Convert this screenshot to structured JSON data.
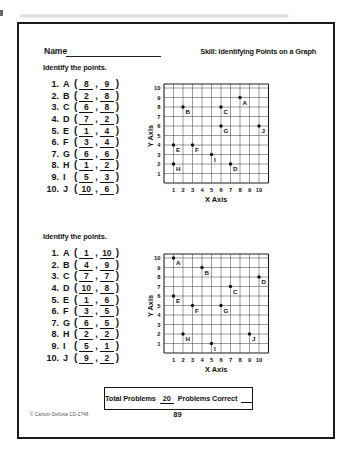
{
  "header": {
    "name_label": "Name",
    "skill_label": "Skill:  Identifying Points on a Graph"
  },
  "sections": [
    {
      "instruction": "Identify the points.",
      "problems": [
        {
          "num": "1.",
          "letter": "A",
          "x": "8",
          "y": "9"
        },
        {
          "num": "2.",
          "letter": "B",
          "x": "2",
          "y": "8"
        },
        {
          "num": "3.",
          "letter": "C",
          "x": "6",
          "y": "8"
        },
        {
          "num": "4.",
          "letter": "D",
          "x": "7",
          "y": "2"
        },
        {
          "num": "5.",
          "letter": "E",
          "x": "1",
          "y": "4"
        },
        {
          "num": "6.",
          "letter": "F",
          "x": "3",
          "y": "4"
        },
        {
          "num": "7.",
          "letter": "G",
          "x": "6",
          "y": "6"
        },
        {
          "num": "8.",
          "letter": "H",
          "x": "1",
          "y": "2"
        },
        {
          "num": "9.",
          "letter": "I",
          "x": "5",
          "y": "3"
        },
        {
          "num": "10.",
          "letter": "J",
          "x": "10",
          "y": "6"
        }
      ],
      "graph": {
        "x_axis_label": "X Axis",
        "y_axis_label": "Y Axis",
        "ticks": [
          1,
          2,
          3,
          4,
          5,
          6,
          7,
          8,
          9,
          10
        ],
        "points": [
          {
            "label": "A",
            "x": 8,
            "y": 9
          },
          {
            "label": "B",
            "x": 2,
            "y": 8
          },
          {
            "label": "C",
            "x": 6,
            "y": 8
          },
          {
            "label": "D",
            "x": 7,
            "y": 2
          },
          {
            "label": "E",
            "x": 1,
            "y": 4
          },
          {
            "label": "F",
            "x": 3,
            "y": 4
          },
          {
            "label": "G",
            "x": 6,
            "y": 6
          },
          {
            "label": "H",
            "x": 1,
            "y": 2
          },
          {
            "label": "I",
            "x": 5,
            "y": 3
          },
          {
            "label": "J",
            "x": 10,
            "y": 6
          }
        ]
      }
    },
    {
      "instruction": "Identify the points.",
      "problems": [
        {
          "num": "1.",
          "letter": "A",
          "x": "1",
          "y": "10"
        },
        {
          "num": "2.",
          "letter": "B",
          "x": "4",
          "y": "9"
        },
        {
          "num": "3.",
          "letter": "C",
          "x": "7",
          "y": "7"
        },
        {
          "num": "4.",
          "letter": "D",
          "x": "10",
          "y": "8"
        },
        {
          "num": "5.",
          "letter": "E",
          "x": "1",
          "y": "6"
        },
        {
          "num": "6.",
          "letter": "F",
          "x": "3",
          "y": "5"
        },
        {
          "num": "7.",
          "letter": "G",
          "x": "6",
          "y": "5"
        },
        {
          "num": "8.",
          "letter": "H",
          "x": "2",
          "y": "2"
        },
        {
          "num": "9.",
          "letter": "I",
          "x": "5",
          "y": "1"
        },
        {
          "num": "10.",
          "letter": "J",
          "x": "9",
          "y": "2"
        }
      ],
      "graph": {
        "x_axis_label": "X Axis",
        "y_axis_label": "Y Axis",
        "ticks": [
          1,
          2,
          3,
          4,
          5,
          6,
          7,
          8,
          9,
          10
        ],
        "points": [
          {
            "label": "A",
            "x": 1,
            "y": 10
          },
          {
            "label": "B",
            "x": 4,
            "y": 9
          },
          {
            "label": "C",
            "x": 7,
            "y": 7
          },
          {
            "label": "D",
            "x": 10,
            "y": 8
          },
          {
            "label": "E",
            "x": 1,
            "y": 6
          },
          {
            "label": "F",
            "x": 3,
            "y": 5
          },
          {
            "label": "G",
            "x": 6,
            "y": 5
          },
          {
            "label": "H",
            "x": 2,
            "y": 2
          },
          {
            "label": "I",
            "x": 5,
            "y": 1
          },
          {
            "label": "J",
            "x": 9,
            "y": 2
          }
        ]
      }
    }
  ],
  "footer": {
    "total_problems_label": "Total Problems",
    "total_problems_value": "20",
    "problems_correct_label": "Problems Correct",
    "page_number": "89",
    "copyright": "© Carson-Dellosa CD-2748"
  },
  "colors": {
    "ink": "#141414",
    "grid_inner": "#4a4a4a",
    "grid_border": "#1c1c1c"
  },
  "chart_data": [
    {
      "type": "scatter",
      "title": "",
      "xlabel": "X Axis",
      "ylabel": "Y Axis",
      "xlim": [
        0,
        11
      ],
      "ylim": [
        0,
        10
      ],
      "grid": true,
      "points": [
        {
          "label": "A",
          "x": 8,
          "y": 9
        },
        {
          "label": "B",
          "x": 2,
          "y": 8
        },
        {
          "label": "C",
          "x": 6,
          "y": 8
        },
        {
          "label": "D",
          "x": 7,
          "y": 2
        },
        {
          "label": "E",
          "x": 1,
          "y": 4
        },
        {
          "label": "F",
          "x": 3,
          "y": 4
        },
        {
          "label": "G",
          "x": 6,
          "y": 6
        },
        {
          "label": "H",
          "x": 1,
          "y": 2
        },
        {
          "label": "I",
          "x": 5,
          "y": 3
        },
        {
          "label": "J",
          "x": 10,
          "y": 6
        }
      ]
    },
    {
      "type": "scatter",
      "title": "",
      "xlabel": "X Axis",
      "ylabel": "Y Axis",
      "xlim": [
        0,
        11
      ],
      "ylim": [
        0,
        10
      ],
      "grid": true,
      "points": [
        {
          "label": "A",
          "x": 1,
          "y": 10
        },
        {
          "label": "B",
          "x": 4,
          "y": 9
        },
        {
          "label": "C",
          "x": 7,
          "y": 7
        },
        {
          "label": "D",
          "x": 10,
          "y": 8
        },
        {
          "label": "E",
          "x": 1,
          "y": 6
        },
        {
          "label": "F",
          "x": 3,
          "y": 5
        },
        {
          "label": "G",
          "x": 6,
          "y": 5
        },
        {
          "label": "H",
          "x": 2,
          "y": 2
        },
        {
          "label": "I",
          "x": 5,
          "y": 1
        },
        {
          "label": "J",
          "x": 9,
          "y": 2
        }
      ]
    }
  ]
}
